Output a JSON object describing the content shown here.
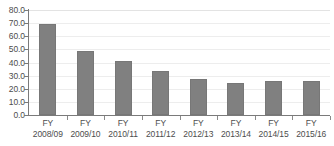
{
  "chart_data": {
    "type": "bar",
    "title": "",
    "subtitle": "",
    "xlabel": "",
    "ylabel": "",
    "categories": [
      "FY 2008/09",
      "FY 2009/10",
      "FY 2010/11",
      "FY 2011/12",
      "FY 2012/13",
      "FY 2013/14",
      "FY 2014/15",
      "FY 2015/16"
    ],
    "category_lines": [
      {
        "line1": "FY",
        "line2": "2008/09"
      },
      {
        "line1": "FY",
        "line2": "2009/10"
      },
      {
        "line1": "FY",
        "line2": "2010/11"
      },
      {
        "line1": "FY",
        "line2": "2011/12"
      },
      {
        "line1": "FY",
        "line2": "2012/13"
      },
      {
        "line1": "FY",
        "line2": "2013/14"
      },
      {
        "line1": "FY",
        "line2": "2014/15"
      },
      {
        "line1": "FY",
        "line2": "2015/16"
      }
    ],
    "values": [
      69.7,
      48.7,
      41.0,
      33.6,
      27.3,
      24.6,
      25.9,
      25.7
    ],
    "ylim": [
      0.0,
      80.0
    ],
    "ytick_values": [
      0.0,
      10.0,
      20.0,
      30.0,
      40.0,
      50.0,
      60.0,
      70.0,
      80.0
    ],
    "ytick_labels": [
      "0.0",
      "10.0",
      "20.0",
      "30.0",
      "40.0",
      "50.0",
      "60.0",
      "70.0",
      "80.0"
    ],
    "grid": true,
    "grid_axis": "y",
    "legend": false,
    "legend_position": "none",
    "bar_color": "#808080",
    "bar_border_color": "#777777",
    "gridline_color": "#ededed",
    "axis_color": "#7a7a7a",
    "tick_label_color": "#4d4d4d",
    "background_color": "#ffffff"
  }
}
